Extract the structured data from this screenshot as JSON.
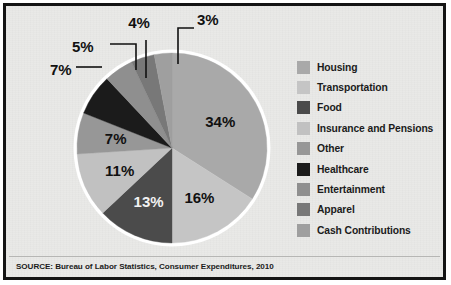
{
  "chart_data": {
    "type": "pie",
    "title": "",
    "subtitle": "",
    "xlabel": "",
    "ylabel": "",
    "legend_position": "right",
    "grid": false,
    "unit": "%",
    "start_angle_deg": 0,
    "direction": "clockwise",
    "categories": [
      "Housing",
      "Transportation",
      "Food",
      "Insurance and Pensions",
      "Other",
      "Healthcare",
      "Entertainment",
      "Apparel",
      "Cash Contributions"
    ],
    "values": [
      34,
      16,
      13,
      11,
      7,
      7,
      5,
      4,
      3
    ],
    "labels": [
      "34%",
      "16%",
      "13%",
      "11%",
      "7%",
      "7%",
      "5%",
      "4%",
      "3%"
    ],
    "colors": [
      "#a9a9a9",
      "#c5c5c5",
      "#4b4b4b",
      "#c1c1c1",
      "#979797",
      "#1b1b1b",
      "#8f8f8f",
      "#787878",
      "#9f9f9f"
    ],
    "slices": [
      {
        "name": "Housing",
        "value": 34,
        "label": "34%",
        "color": "#a9a9a9",
        "label_placement": "inside"
      },
      {
        "name": "Transportation",
        "value": 16,
        "label": "16%",
        "color": "#c5c5c5",
        "label_placement": "inside"
      },
      {
        "name": "Food",
        "value": 13,
        "label": "13%",
        "color": "#4b4b4b",
        "label_placement": "inside"
      },
      {
        "name": "Insurance and Pensions",
        "value": 11,
        "label": "11%",
        "color": "#c1c1c1",
        "label_placement": "inside"
      },
      {
        "name": "Other",
        "value": 7,
        "label": "7%",
        "color": "#979797",
        "label_placement": "inside"
      },
      {
        "name": "Healthcare",
        "value": 7,
        "label": "7%",
        "color": "#1b1b1b",
        "label_placement": "callout"
      },
      {
        "name": "Entertainment",
        "value": 5,
        "label": "5%",
        "color": "#8f8f8f",
        "label_placement": "callout"
      },
      {
        "name": "Apparel",
        "value": 4,
        "label": "4%",
        "color": "#787878",
        "label_placement": "callout"
      },
      {
        "name": "Cash Contributions",
        "value": 3,
        "label": "3%",
        "color": "#9f9f9f",
        "label_placement": "callout"
      }
    ]
  },
  "legend": {
    "items": [
      {
        "label": "Housing",
        "color": "#a9a9a9"
      },
      {
        "label": "Transportation",
        "color": "#c5c5c5"
      },
      {
        "label": "Food",
        "color": "#4b4b4b"
      },
      {
        "label": "Insurance and Pensions",
        "color": "#c1c1c1"
      },
      {
        "label": "Other",
        "color": "#979797"
      },
      {
        "label": "Healthcare",
        "color": "#1b1b1b"
      },
      {
        "label": "Entertainment",
        "color": "#8f8f8f"
      },
      {
        "label": "Apparel",
        "color": "#787878"
      },
      {
        "label": "Cash Contributions",
        "color": "#9f9f9f"
      }
    ]
  },
  "footer": {
    "source": "SOURCE:  Bureau of Labor Statistics, Consumer Expenditures, 2010"
  },
  "theme": {
    "background": "#e9e9e7",
    "frame_border": "#141414",
    "pie_ring": "#ffffff",
    "text": "#1b1b1b"
  },
  "inner_labels": {
    "housing": "34%",
    "transportation": "16%",
    "food": "13%",
    "insurance": "11%",
    "other": "7%"
  },
  "callout_labels": {
    "healthcare": "7%",
    "entertainment": "5%",
    "apparel": "4%",
    "cash_contributions": "3%"
  }
}
